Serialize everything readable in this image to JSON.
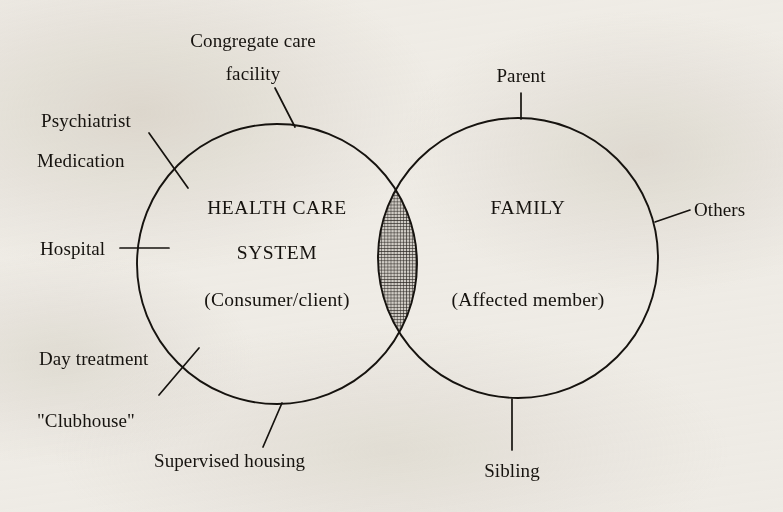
{
  "diagram": {
    "type": "venn-two-circle",
    "background_color": "#f4f2ee",
    "stroke_color": "#16130f",
    "intersection_fill": "crosshatch-gray",
    "circles": [
      {
        "id": "health-care-system",
        "heading_line1": "HEALTH CARE",
        "heading_line2": "SYSTEM",
        "subtitle": "(Consumer/client)",
        "cx": 277,
        "cy": 264,
        "r": 140
      },
      {
        "id": "family",
        "heading_line1": "FAMILY",
        "heading_line2": "",
        "subtitle": "(Affected member)",
        "cx": 518,
        "cy": 258,
        "r": 140
      }
    ],
    "intersection": {
      "label": "",
      "description": "shaded overlap region"
    }
  },
  "labels": {
    "congregate_care_line1": "Congregate care",
    "congregate_care_line2": "facility",
    "psychiatrist": "Psychiatrist",
    "medication": "Medication",
    "hospital": "Hospital",
    "day_treatment": "Day treatment",
    "clubhouse": "\"Clubhouse\"",
    "supervised_housing": "Supervised housing",
    "parent": "Parent",
    "others": "Others",
    "sibling": "Sibling"
  },
  "interior_text": {
    "left_heading_1": "HEALTH CARE",
    "left_heading_2": "SYSTEM",
    "left_subtitle": "(Consumer/client)",
    "right_heading_1": "FAMILY",
    "right_subtitle": "(Affected member)"
  }
}
